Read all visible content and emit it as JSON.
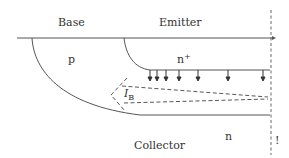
{
  "diagram": {
    "type": "bipolar transistor cross-section",
    "labels": {
      "base": "Base",
      "emitter": "Emitter",
      "p_region": "p",
      "emitter_region": "n",
      "emitter_region_sup": "+",
      "base_current_main": "I",
      "base_current_sub": "B",
      "collector_region": "n",
      "collector": "Collector",
      "edge_mark": "!"
    },
    "colors": {
      "line": "#555555",
      "text": "#333333",
      "background": "#ffffff"
    },
    "electron_injection_arrows": 7
  }
}
